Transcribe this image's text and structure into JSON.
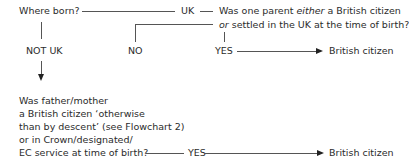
{
  "flowchart": {
    "q1": "Where born?",
    "uk": "UK",
    "q2_line1_pre": "Was one parent ",
    "q2_line1_em": "either",
    "q2_line1_post": " a British citizen",
    "q2_line2_em": "or",
    "q2_line2_post": " settled in the UK at the time of birth?",
    "no": "NO",
    "yes1": "YES",
    "result1": "British citizen",
    "not_uk": "NOT UK",
    "q3_lines": [
      "Was father/mother",
      "a British citizen ‘otherwise",
      "than by descent’ (see Flowchart 2)",
      "or in Crown/designated/",
      "EC service at time of birth?"
    ],
    "yes2": "YES",
    "result2": "British citizen"
  }
}
